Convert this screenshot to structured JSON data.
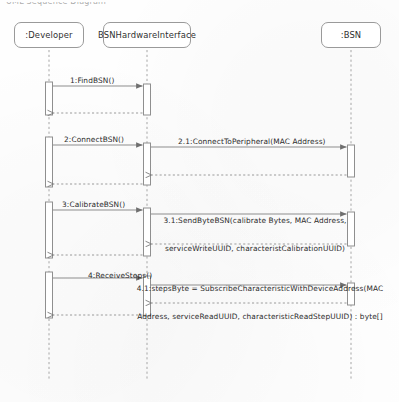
{
  "diagram": {
    "type": "uml-sequence-diagram",
    "top_cropped_caption": "UML Sequence Diagram",
    "colors": {
      "line": "#8d8d8d",
      "box_border": "#9a9a9a",
      "text": "#2b2b2b",
      "background": "#fefefe"
    },
    "participants": [
      {
        "id": "developer",
        "label": ":Developer",
        "x": 49
      },
      {
        "id": "interface",
        "label": "BSNHardwareInterface",
        "x": 147
      },
      {
        "id": "bsn",
        "label": ":BSN",
        "x": 351
      }
    ],
    "messages": [
      {
        "id": "m1",
        "number": "1",
        "label": "1:FindBSN()",
        "from": "developer",
        "to": "interface",
        "kind": "call"
      },
      {
        "id": "m2",
        "number": "2",
        "label": "2:ConnectBSN()",
        "from": "developer",
        "to": "interface",
        "kind": "call"
      },
      {
        "id": "m2_1",
        "number": "2.1",
        "label": "2.1:ConnectToPeripheral(MAC Address)",
        "from": "interface",
        "to": "bsn",
        "kind": "call"
      },
      {
        "id": "m3",
        "number": "3",
        "label": "3:CalibrateBSN()",
        "from": "developer",
        "to": "interface",
        "kind": "call"
      },
      {
        "id": "m3_1",
        "number": "3.1",
        "label_line1": "3.1:SendByteBSN(calibrate Bytes, MAC Address,",
        "label_line2": "serviceWriteUUID, characteristCalibrationUUID)",
        "from": "interface",
        "to": "bsn",
        "kind": "call"
      },
      {
        "id": "m4",
        "number": "4",
        "label": "4:ReceiveSteps()",
        "from": "developer",
        "to": "interface",
        "kind": "call"
      },
      {
        "id": "m4_1",
        "number": "4.1",
        "label_line1": "4.1:stepsByte = SubscribeCharacteristicWithDeviceAddress(MAC",
        "label_line2": "Address, serviceReadUUID, characteristicReadStepUUID) : byte[]",
        "from": "interface",
        "to": "bsn",
        "kind": "call"
      }
    ],
    "returns": [
      {
        "id": "r1",
        "from": "interface",
        "to": "developer",
        "kind": "return"
      },
      {
        "id": "r2_1",
        "from": "bsn",
        "to": "interface",
        "kind": "return"
      },
      {
        "id": "r2",
        "from": "interface",
        "to": "developer",
        "kind": "return"
      },
      {
        "id": "r3_1",
        "from": "bsn",
        "to": "interface",
        "kind": "return"
      },
      {
        "id": "r3",
        "from": "interface",
        "to": "developer",
        "kind": "return"
      },
      {
        "id": "r4_1",
        "from": "bsn",
        "to": "interface",
        "kind": "return"
      },
      {
        "id": "r4",
        "from": "interface",
        "to": "developer",
        "kind": "return"
      }
    ]
  }
}
